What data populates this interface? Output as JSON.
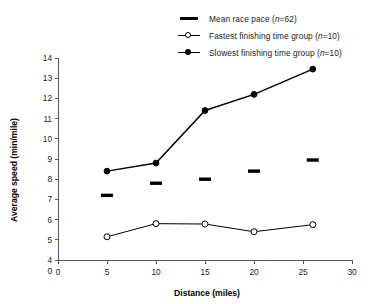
{
  "chart_data": {
    "type": "line",
    "title": "",
    "xlabel": "Distance (miles)",
    "ylabel": "Average speed (min/mile)",
    "xlim": [
      0,
      30
    ],
    "ylim": [
      4,
      14
    ],
    "xticks": [
      0,
      5,
      10,
      15,
      20,
      25,
      30
    ],
    "xtick_labels": [
      "0",
      "5",
      "10",
      "15",
      "20",
      "25",
      "30"
    ],
    "yticks": [
      4,
      5,
      6,
      7,
      8,
      9,
      10,
      11,
      12,
      13,
      14
    ],
    "ytick_labels": [
      "4",
      "5",
      "6",
      "7",
      "8",
      "9",
      "10",
      "11",
      "12",
      "13",
      "14"
    ],
    "y_origin_label": "0",
    "axis_break": true,
    "grid": false,
    "legend_position": "top-right",
    "x": [
      5,
      10,
      15,
      20,
      26
    ],
    "series": [
      {
        "name": "Mean race pace (n=62)",
        "marker": "thick-dash",
        "values": [
          7.2,
          7.8,
          8.0,
          8.4,
          8.95
        ]
      },
      {
        "name": "Fastest finishing time group (n=10)",
        "marker": "open-circle",
        "values": [
          5.15,
          5.8,
          5.78,
          5.4,
          5.75
        ]
      },
      {
        "name": "Slowest finishing time group (n=10)",
        "marker": "filled-circle",
        "values": [
          8.4,
          8.8,
          11.4,
          12.2,
          13.45
        ]
      }
    ]
  },
  "legend": {
    "items": [
      {
        "label_main": "Mean race pace (",
        "label_italic": "n",
        "label_tail": "=62)",
        "marker": "thick-dash"
      },
      {
        "label_main": "Fastest finishing time group (",
        "label_italic": "n",
        "label_tail": "=10)",
        "marker": "open-circle"
      },
      {
        "label_main": "Slowest finishing time group (",
        "label_italic": "n",
        "label_tail": "=10)",
        "marker": "filled-circle"
      }
    ]
  }
}
